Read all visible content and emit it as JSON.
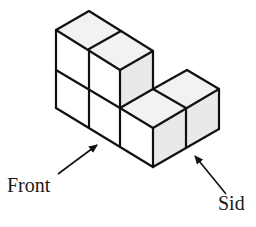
{
  "diagram": {
    "type": "isometric-cube-structure",
    "cube_count": 6,
    "labels": {
      "front": "Front",
      "side": "Sid"
    },
    "colors": {
      "stroke": "#111111",
      "top_face": "#f2f2f2",
      "front_face": "#ffffff",
      "side_face": "#e9e9e9",
      "background": "#ffffff"
    }
  }
}
